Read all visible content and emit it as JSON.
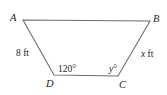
{
  "figure": {
    "type": "trapezoid",
    "vertices": [
      {
        "name": "A",
        "x": 23,
        "y": 20
      },
      {
        "name": "B",
        "x": 150,
        "y": 21
      },
      {
        "name": "C",
        "x": 118,
        "y": 76
      },
      {
        "name": "D",
        "x": 54,
        "y": 75
      }
    ],
    "labels": {
      "A": "A",
      "B": "B",
      "C": "C",
      "D": "D",
      "side_AD": "8 ft",
      "side_BC_var": "x",
      "side_BC_unit": " ft",
      "angle_D": "120°",
      "angle_C_var": "y",
      "angle_C_unit": "°"
    },
    "colors": {
      "line": "#6e6e6e",
      "text": "#222222"
    }
  }
}
